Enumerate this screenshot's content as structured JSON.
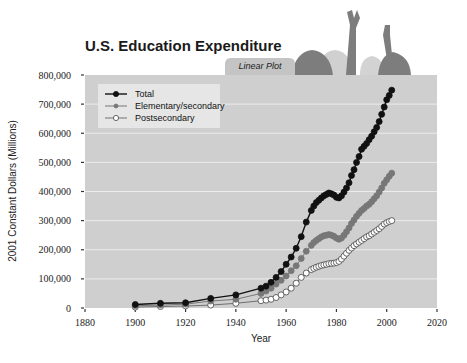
{
  "chart_data": {
    "type": "line",
    "title": "U.S. Education Expenditure",
    "tab_label": "Linear Plot",
    "xlabel": "Year",
    "ylabel": "2001 Constant Dollars (Millions)",
    "xlim": [
      1880,
      2020
    ],
    "ylim": [
      0,
      800000
    ],
    "xticks": [
      1880,
      1900,
      1920,
      1940,
      1960,
      1980,
      2000,
      2020
    ],
    "xtick_labels": [
      "1880",
      "1900",
      "1920",
      "1940",
      "1960",
      "1980",
      "2000",
      "2020"
    ],
    "yticks": [
      0,
      100000,
      200000,
      300000,
      400000,
      500000,
      600000,
      700000,
      800000
    ],
    "ytick_labels": [
      "0",
      "100,000",
      "200,000",
      "300,000",
      "400,000",
      "500,000",
      "600,000",
      "700,000",
      "800,000"
    ],
    "grid": true,
    "legend_position": "top-left",
    "series": [
      {
        "name": "Total",
        "marker": "filled-black",
        "color": "#111111",
        "x": [
          1900,
          1910,
          1920,
          1930,
          1940,
          1950,
          1952,
          1954,
          1956,
          1958,
          1960,
          1962,
          1964,
          1966,
          1968,
          1970,
          1971,
          1972,
          1973,
          1974,
          1975,
          1976,
          1977,
          1978,
          1979,
          1980,
          1981,
          1982,
          1983,
          1984,
          1985,
          1986,
          1987,
          1988,
          1989,
          1990,
          1991,
          1992,
          1993,
          1994,
          1995,
          1996,
          1997,
          1998,
          1999,
          2000,
          2001,
          2002
        ],
        "y": [
          12000,
          16000,
          18000,
          33000,
          45000,
          68000,
          75000,
          88000,
          105000,
          125000,
          150000,
          175000,
          205000,
          245000,
          295000,
          335000,
          350000,
          362000,
          370000,
          378000,
          385000,
          390000,
          395000,
          392000,
          388000,
          380000,
          378000,
          385000,
          398000,
          412000,
          430000,
          455000,
          475000,
          500000,
          520000,
          545000,
          555000,
          565000,
          578000,
          590000,
          605000,
          620000,
          640000,
          665000,
          690000,
          715000,
          730000,
          748000
        ]
      },
      {
        "name": "Elementary/secondary",
        "marker": "filled-gray",
        "color": "#777777",
        "x": [
          1900,
          1910,
          1920,
          1930,
          1940,
          1950,
          1952,
          1954,
          1956,
          1958,
          1960,
          1962,
          1964,
          1966,
          1968,
          1970,
          1971,
          1972,
          1973,
          1974,
          1975,
          1976,
          1977,
          1978,
          1979,
          1980,
          1981,
          1982,
          1983,
          1984,
          1985,
          1986,
          1987,
          1988,
          1989,
          1990,
          1991,
          1992,
          1993,
          1994,
          1995,
          1996,
          1997,
          1998,
          1999,
          2000,
          2001,
          2002
        ],
        "y": [
          8000,
          10000,
          13000,
          24000,
          30000,
          50000,
          58000,
          68000,
          82000,
          95000,
          110000,
          128000,
          145000,
          170000,
          195000,
          215000,
          225000,
          232000,
          238000,
          244000,
          248000,
          250000,
          252000,
          250000,
          246000,
          240000,
          236000,
          240000,
          250000,
          262000,
          275000,
          290000,
          302000,
          315000,
          325000,
          335000,
          342000,
          350000,
          356000,
          365000,
          375000,
          385000,
          398000,
          412000,
          428000,
          440000,
          452000,
          463000
        ]
      },
      {
        "name": "Postsecondary",
        "marker": "open-white",
        "color": "#444444",
        "x": [
          1900,
          1910,
          1920,
          1930,
          1940,
          1950,
          1952,
          1954,
          1956,
          1958,
          1960,
          1962,
          1964,
          1966,
          1968,
          1970,
          1971,
          1972,
          1973,
          1974,
          1975,
          1976,
          1977,
          1978,
          1979,
          1980,
          1981,
          1982,
          1983,
          1984,
          1985,
          1986,
          1987,
          1988,
          1989,
          1990,
          1991,
          1992,
          1993,
          1994,
          1995,
          1996,
          1997,
          1998,
          1999,
          2000,
          2001,
          2002
        ],
        "y": [
          3000,
          5000,
          7000,
          10000,
          16000,
          25000,
          27000,
          30000,
          36000,
          45000,
          55000,
          68000,
          85000,
          105000,
          120000,
          132000,
          136000,
          140000,
          143000,
          146000,
          148000,
          150000,
          152000,
          153000,
          154000,
          156000,
          160000,
          168000,
          178000,
          188000,
          198000,
          206000,
          214000,
          220000,
          226000,
          232000,
          238000,
          244000,
          248000,
          254000,
          260000,
          266000,
          272000,
          280000,
          288000,
          293000,
          297000,
          300000
        ]
      }
    ]
  }
}
